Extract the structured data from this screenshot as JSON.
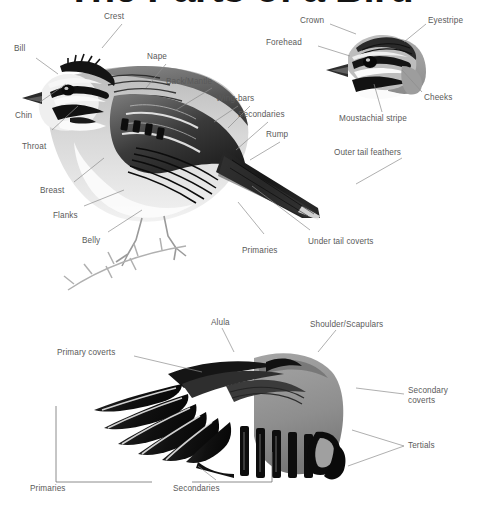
{
  "title": "The Parts of a Bird",
  "figures": {
    "main_bird": {
      "name": "perched-sparrow-side-view",
      "labels": [
        {
          "key": "crest",
          "text": "Crest"
        },
        {
          "key": "bill",
          "text": "Bill"
        },
        {
          "key": "nape",
          "text": "Nape"
        },
        {
          "key": "chin",
          "text": "Chin"
        },
        {
          "key": "back_mantle",
          "text": "Back/Mantle"
        },
        {
          "key": "wing_bars",
          "text": "Wing-bars"
        },
        {
          "key": "secondaries",
          "text": "Secondaries"
        },
        {
          "key": "throat",
          "text": "Throat"
        },
        {
          "key": "rump",
          "text": "Rump"
        },
        {
          "key": "outer_tail_feathers",
          "text": "Outer tail feathers"
        },
        {
          "key": "breast",
          "text": "Breast"
        },
        {
          "key": "flanks",
          "text": "Flanks"
        },
        {
          "key": "belly",
          "text": "Belly"
        },
        {
          "key": "primaries",
          "text": "Primaries"
        },
        {
          "key": "under_tail_coverts",
          "text": "Under tail coverts"
        }
      ]
    },
    "head_detail": {
      "name": "sparrow-head-close-up",
      "labels": [
        {
          "key": "crown",
          "text": "Crown"
        },
        {
          "key": "eyestripe",
          "text": "Eyestripe"
        },
        {
          "key": "forehead",
          "text": "Forehead"
        },
        {
          "key": "cheeks",
          "text": "Cheeks"
        },
        {
          "key": "moustachial_stripe",
          "text": "Moustachial stripe"
        }
      ]
    },
    "wing_detail": {
      "name": "spread-wing-upperside",
      "labels": [
        {
          "key": "alula",
          "text": "Alula"
        },
        {
          "key": "shoulder_scapulars",
          "text": "Shoulder/Scapulars"
        },
        {
          "key": "primary_coverts",
          "text": "Primary coverts"
        },
        {
          "key": "secondary_coverts",
          "text": "Secondary\ncoverts"
        },
        {
          "key": "secondary_coverts_l1",
          "text": "Secondary"
        },
        {
          "key": "secondary_coverts_l2",
          "text": "coverts"
        },
        {
          "key": "tertials",
          "text": "Tertials"
        },
        {
          "key": "primaries",
          "text": "Primaries"
        },
        {
          "key": "secondaries",
          "text": "Secondaries"
        }
      ]
    }
  },
  "colors": {
    "background": "#ffffff",
    "title_text": "#141414",
    "label_text": "#5a5a5a",
    "leader_line": "#8d8d8d",
    "bracket_line": "#6f6f6f",
    "plumage_dark": "#1a1a1a",
    "plumage_mid": "#6e6e6e",
    "plumage_light": "#c9c9c9",
    "plumage_white": "#f4f4f4"
  }
}
